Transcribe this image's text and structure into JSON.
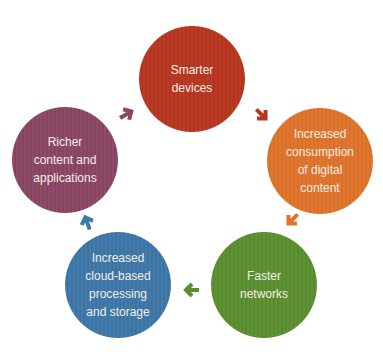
{
  "diagram": {
    "type": "cycle",
    "nodes": [
      {
        "id": "smarter-devices",
        "label": "Smarter\ndevices",
        "color": "#B8361F"
      },
      {
        "id": "increased-consumption",
        "label": "Increased\nconsumption\nof digital\ncontent",
        "color": "#E0742A"
      },
      {
        "id": "faster-networks",
        "label": "Faster\nnetworks",
        "color": "#5A8F2E"
      },
      {
        "id": "cloud-processing",
        "label": "Increased\ncloud-based\nprocessing\nand storage",
        "color": "#3D78A8"
      },
      {
        "id": "richer-content",
        "label": "Richer\ncontent and\napplications",
        "color": "#8A4664"
      }
    ],
    "edges": [
      {
        "from": "smarter-devices",
        "to": "increased-consumption",
        "color": "#B8361F"
      },
      {
        "from": "increased-consumption",
        "to": "faster-networks",
        "color": "#E0742A"
      },
      {
        "from": "faster-networks",
        "to": "cloud-processing",
        "color": "#5A8F2E"
      },
      {
        "from": "cloud-processing",
        "to": "richer-content",
        "color": "#3D78A8"
      },
      {
        "from": "richer-content",
        "to": "smarter-devices",
        "color": "#8A4664"
      }
    ]
  }
}
